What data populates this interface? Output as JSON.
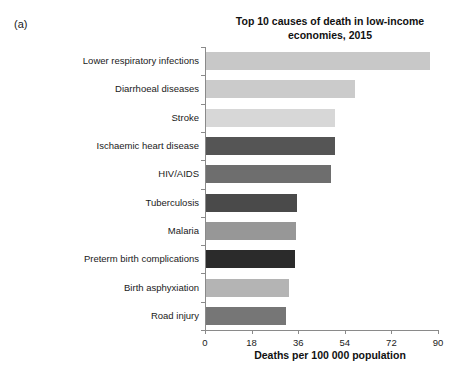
{
  "panel": {
    "letter": "(a)"
  },
  "chart_data": {
    "type": "bar",
    "orientation": "horizontal",
    "title": "Top 10 causes of death in low-income economies, 2015",
    "title_lines": [
      "Top 10 causes of death in low-income",
      "economies, 2015"
    ],
    "xlabel": "Deaths per 100 000 population",
    "ylabel": "",
    "xlim": [
      0,
      90
    ],
    "xticks": [
      0,
      18,
      36,
      54,
      72,
      90
    ],
    "xtick_labels": [
      "0",
      "18",
      "36",
      "54",
      "72",
      "90"
    ],
    "grid": false,
    "legend": false,
    "categories": [
      "Lower respiratory infections",
      "Diarrhoeal diseases",
      "Stroke",
      "Ischaemic heart disease",
      "HIV/AIDS",
      "Tuberculosis",
      "Malaria",
      "Preterm birth complications",
      "Birth asphyxiation",
      "Road injury"
    ],
    "values": [
      86.4,
      57.6,
      50.0,
      49.8,
      48.2,
      35.2,
      34.9,
      34.2,
      31.9,
      30.8
    ],
    "bar_colors": [
      "#c8c8c8",
      "#cbcbcb",
      "#d7d7d7",
      "#555555",
      "#6e6e6e",
      "#4a4a4a",
      "#979797",
      "#2b2b2b",
      "#b4b4b4",
      "#767676"
    ],
    "axis_color": "#8a8a8a",
    "background": "#ffffff"
  }
}
